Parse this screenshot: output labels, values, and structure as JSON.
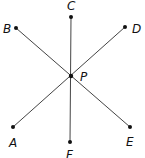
{
  "diagram": {
    "type": "geometry",
    "center": {
      "label": "P",
      "x": 71,
      "y": 76
    },
    "points": [
      {
        "label": "A",
        "x": 13,
        "y": 127
      },
      {
        "label": "B",
        "x": 16,
        "y": 28
      },
      {
        "label": "C",
        "x": 71,
        "y": 17
      },
      {
        "label": "D",
        "x": 125,
        "y": 27
      },
      {
        "label": "E",
        "x": 130,
        "y": 127
      },
      {
        "label": "F",
        "x": 70,
        "y": 142
      }
    ],
    "segments": [
      {
        "from": "A",
        "to": "D"
      },
      {
        "from": "B",
        "to": "E"
      },
      {
        "from": "C",
        "to": "F"
      }
    ],
    "labels": {
      "A": "A",
      "B": "B",
      "C": "C",
      "D": "D",
      "E": "E",
      "F": "F",
      "P": "P"
    },
    "colors": {
      "line": "#444444",
      "point": "#111111",
      "text": "#111111"
    }
  }
}
